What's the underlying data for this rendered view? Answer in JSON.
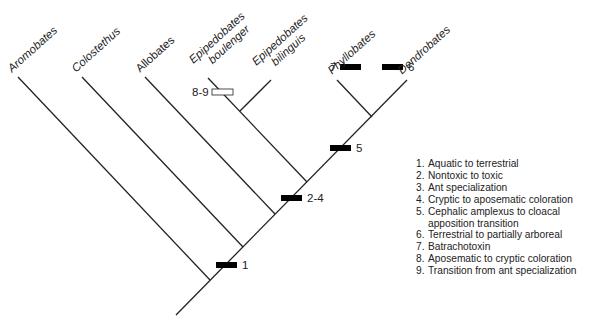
{
  "taxa": [
    {
      "id": "aromobates",
      "lines": [
        "Aromobates"
      ],
      "italic": true
    },
    {
      "id": "colostethus",
      "lines": [
        "Colostethus"
      ],
      "italic": true
    },
    {
      "id": "allobates",
      "lines": [
        "Allobates"
      ],
      "italic": false
    },
    {
      "id": "epipedobates-boulenger",
      "lines": [
        "Epipedobates",
        "boulenger"
      ],
      "italic": true
    },
    {
      "id": "epipedobates-bilinguis",
      "lines": [
        "Epipedobates",
        "bilinguis"
      ],
      "italic": true
    },
    {
      "id": "phyllobates",
      "lines": [
        "Phyllobates"
      ],
      "italic": true
    },
    {
      "id": "dendrobates",
      "lines": [
        "Dendrobates"
      ],
      "italic": true
    }
  ],
  "markers": [
    {
      "label": "1",
      "fill": "black"
    },
    {
      "label": "2-4",
      "fill": "black"
    },
    {
      "label": "5",
      "fill": "black"
    },
    {
      "label": "7",
      "fill": "black"
    },
    {
      "label": "6",
      "fill": "black"
    },
    {
      "label": "8-9",
      "fill": "white"
    }
  ],
  "legend": [
    {
      "num": "1.",
      "text": "Aquatic to terrestrial"
    },
    {
      "num": "2.",
      "text": "Nontoxic to toxic"
    },
    {
      "num": "3.",
      "text": "Ant specialization"
    },
    {
      "num": "4.",
      "text": "Cryptic to aposematic coloration"
    },
    {
      "num": "5.",
      "text": "Cephalic amplexus to cloacal"
    },
    {
      "num": "",
      "text": "apposition transition"
    },
    {
      "num": "6.",
      "text": "Terrestrial to partially arboreal"
    },
    {
      "num": "7.",
      "text": "Batrachotoxin"
    },
    {
      "num": "8.",
      "text": "Aposematic to cryptic coloration"
    },
    {
      "num": "9.",
      "text": "Transition from ant specialization"
    }
  ],
  "colors": {
    "line": "#222222",
    "marker_filled": "#000000",
    "marker_open": "#ffffff"
  }
}
